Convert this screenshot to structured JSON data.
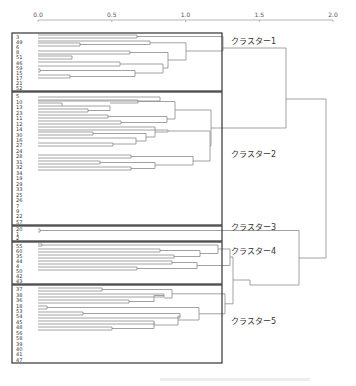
{
  "axis": {
    "ticks": [
      {
        "v": 0.0,
        "label": "0.0"
      },
      {
        "v": 0.5,
        "label": "0.5"
      },
      {
        "v": 1.0,
        "label": "1.0"
      },
      {
        "v": 1.5,
        "label": "1.5"
      },
      {
        "v": 2.0,
        "label": "2.0"
      }
    ],
    "x0": 38,
    "x_per_unit": 147.5,
    "y": 20
  },
  "clusters": [
    {
      "name": "クラスター1",
      "box": [
        12,
        33,
        222,
        91
      ],
      "label_y": 44,
      "leaves": [
        "3",
        "49",
        "6",
        "8",
        "51",
        "46",
        "59",
        "15",
        "17",
        "21",
        "52"
      ]
    },
    {
      "name": "クラスター2",
      "box": [
        12,
        92,
        222,
        225
      ],
      "label_y": 157,
      "leaves": [
        "5",
        "10",
        "13",
        "23",
        "11",
        "12",
        "14",
        "30",
        "16",
        "27",
        "24",
        "28",
        "31",
        "32",
        "34",
        "19",
        "29",
        "33",
        "25",
        "26",
        "7",
        "9",
        "22",
        "57"
      ]
    },
    {
      "name": "クラスター3",
      "box": [
        12,
        226,
        222,
        241
      ],
      "label_y": 230,
      "leaves": [
        "20",
        "1",
        "2"
      ]
    },
    {
      "name": "クラスター4",
      "box": [
        12,
        242,
        222,
        284
      ],
      "label_y": 254,
      "leaves": [
        "55",
        "60",
        "35",
        "44",
        "4",
        "50",
        "42",
        "43"
      ]
    },
    {
      "name": "クラスター5",
      "box": [
        12,
        285,
        222,
        363
      ],
      "label_y": 324,
      "leaves": [
        "37",
        "38",
        "36",
        "18",
        "53",
        "54",
        "45",
        "48",
        "56",
        "58",
        "39",
        "40",
        "41",
        "47"
      ]
    }
  ],
  "chart_data": {
    "type": "dendrogram",
    "title": "",
    "xlabel": "",
    "xlim": [
      0.0,
      2.0
    ],
    "tick_labels": [
      "0.0",
      "0.5",
      "1.0",
      "1.5",
      "2.0"
    ],
    "leaf_order": [
      "3",
      "49",
      "6",
      "8",
      "51",
      "46",
      "59",
      "15",
      "17",
      "21",
      "52",
      "5",
      "10",
      "13",
      "23",
      "11",
      "12",
      "14",
      "30",
      "16",
      "27",
      "24",
      "28",
      "31",
      "32",
      "34",
      "19",
      "29",
      "33",
      "25",
      "26",
      "7",
      "9",
      "22",
      "57",
      "20",
      "1",
      "2",
      "55",
      "60",
      "35",
      "44",
      "4",
      "50",
      "42",
      "43",
      "37",
      "38",
      "36",
      "18",
      "53",
      "54",
      "45",
      "48",
      "56",
      "58",
      "39",
      "40",
      "41",
      "47"
    ],
    "clusters": [
      {
        "name": "クラスター1",
        "members": [
          "3",
          "49",
          "6",
          "8",
          "51",
          "46",
          "59",
          "15",
          "17",
          "21",
          "52"
        ]
      },
      {
        "name": "クラスター2",
        "members": [
          "5",
          "10",
          "13",
          "23",
          "11",
          "12",
          "14",
          "30",
          "16",
          "27",
          "24",
          "28",
          "31",
          "32",
          "34",
          "19",
          "29",
          "33",
          "25",
          "26",
          "7",
          "9",
          "22",
          "57"
        ]
      },
      {
        "name": "クラスター3",
        "members": [
          "20",
          "1",
          "2"
        ]
      },
      {
        "name": "クラスター4",
        "members": [
          "55",
          "60",
          "35",
          "44",
          "4",
          "50",
          "42",
          "43"
        ]
      },
      {
        "name": "クラスター5",
        "members": [
          "37",
          "38",
          "36",
          "18",
          "53",
          "54",
          "45",
          "48",
          "56",
          "58",
          "39",
          "40",
          "41",
          "47"
        ]
      }
    ],
    "merge_heights_approx": {
      "cluster1": 1.15,
      "cluster2": 1.25,
      "cluster3": 0.02,
      "cluster4": 1.08,
      "cluster5": 1.1,
      "c4_c5": 1.15,
      "c3_c45": 1.77,
      "c1_c2": 1.68,
      "root": 1.95
    }
  },
  "links": [
    [
      [
        38,
        35
      ],
      [
        137,
        35
      ],
      [
        137,
        38
      ],
      [
        38,
        38
      ]
    ],
    [
      [
        38,
        43
      ],
      [
        80,
        43
      ],
      [
        80,
        46
      ],
      [
        38,
        46
      ]
    ],
    [
      [
        38,
        41
      ],
      [
        150,
        41
      ],
      [
        150,
        44.5
      ],
      [
        80,
        44.5
      ]
    ],
    [
      [
        38,
        51
      ],
      [
        130,
        51
      ],
      [
        130,
        54
      ],
      [
        38,
        54
      ]
    ],
    [
      [
        38,
        56
      ],
      [
        72,
        56
      ],
      [
        72,
        59
      ],
      [
        38,
        59
      ]
    ],
    [
      [
        38,
        62
      ],
      [
        120,
        62
      ],
      [
        120,
        66
      ],
      [
        38,
        66
      ]
    ],
    [
      [
        38,
        69
      ],
      [
        40,
        69
      ],
      [
        40,
        72
      ],
      [
        38,
        72
      ]
    ],
    [
      [
        38,
        75
      ],
      [
        70,
        75
      ],
      [
        70,
        78
      ],
      [
        38,
        78
      ]
    ],
    [
      [
        40,
        70.5
      ],
      [
        135,
        70.5
      ],
      [
        135,
        76.5
      ],
      [
        70,
        76.5
      ]
    ],
    [
      [
        120,
        64
      ],
      [
        163,
        64
      ],
      [
        163,
        73
      ],
      [
        135,
        73
      ]
    ],
    [
      [
        130,
        52.5
      ],
      [
        168,
        52.5
      ],
      [
        168,
        68
      ],
      [
        163,
        68
      ]
    ],
    [
      [
        150,
        42.8
      ],
      [
        186,
        42.8
      ],
      [
        186,
        60
      ],
      [
        168,
        60
      ]
    ],
    [
      [
        137,
        36.5
      ],
      [
        223,
        36.5
      ],
      [
        223,
        51
      ],
      [
        186,
        51
      ]
    ],
    [
      [
        38,
        103
      ],
      [
        62,
        103
      ],
      [
        62,
        106
      ],
      [
        38,
        106
      ]
    ],
    [
      [
        38,
        109
      ],
      [
        88,
        109
      ],
      [
        88,
        112
      ],
      [
        38,
        112
      ]
    ],
    [
      [
        38,
        115
      ],
      [
        108,
        115
      ],
      [
        108,
        118
      ],
      [
        38,
        118
      ]
    ],
    [
      [
        38,
        121
      ],
      [
        121,
        121
      ],
      [
        121,
        124
      ],
      [
        38,
        124
      ]
    ],
    [
      [
        88,
        110.5
      ],
      [
        110,
        110.5
      ],
      [
        110,
        106
      ],
      [
        62,
        106
      ]
    ],
    [
      [
        38,
        97
      ],
      [
        160,
        97
      ],
      [
        160,
        101
      ],
      [
        38,
        101
      ]
    ],
    [
      [
        38,
        100
      ],
      [
        138,
        100
      ],
      [
        138,
        103
      ],
      [
        110,
        103
      ]
    ],
    [
      [
        108,
        116.5
      ],
      [
        167,
        116.5
      ],
      [
        167,
        122.5
      ],
      [
        121,
        122.5
      ]
    ],
    [
      [
        138,
        101.5
      ],
      [
        175,
        101.5
      ],
      [
        175,
        119
      ],
      [
        167,
        119
      ]
    ],
    [
      [
        38,
        132
      ],
      [
        93,
        132
      ],
      [
        93,
        135
      ],
      [
        38,
        135
      ]
    ],
    [
      [
        38,
        143
      ],
      [
        113,
        143
      ],
      [
        113,
        146
      ],
      [
        38,
        146
      ]
    ],
    [
      [
        38,
        138
      ],
      [
        136,
        138
      ],
      [
        136,
        144
      ],
      [
        113,
        144
      ]
    ],
    [
      [
        93,
        133.5
      ],
      [
        146,
        133.5
      ],
      [
        146,
        141
      ],
      [
        136,
        141
      ]
    ],
    [
      [
        38,
        127
      ],
      [
        155,
        127
      ],
      [
        155,
        137
      ],
      [
        146,
        137
      ]
    ],
    [
      [
        38,
        130
      ],
      [
        168,
        130
      ],
      [
        168,
        132
      ],
      [
        155,
        132
      ]
    ],
    [
      [
        38,
        155
      ],
      [
        131,
        155
      ],
      [
        131,
        158
      ],
      [
        38,
        158
      ]
    ],
    [
      [
        38,
        161
      ],
      [
        100,
        161
      ],
      [
        100,
        164
      ],
      [
        38,
        164
      ]
    ],
    [
      [
        38,
        167
      ],
      [
        131,
        167
      ],
      [
        131,
        170
      ],
      [
        38,
        170
      ]
    ],
    [
      [
        100,
        162.5
      ],
      [
        155,
        162.5
      ],
      [
        155,
        168.5
      ],
      [
        131,
        168.5
      ]
    ],
    [
      [
        131,
        156.5
      ],
      [
        193,
        156.5
      ],
      [
        193,
        165
      ],
      [
        155,
        165
      ]
    ],
    [
      [
        168,
        131
      ],
      [
        210,
        131
      ],
      [
        210,
        161
      ],
      [
        193,
        161
      ]
    ],
    [
      [
        175,
        110
      ],
      [
        211,
        110
      ],
      [
        211,
        146
      ],
      [
        210,
        146
      ]
    ],
    [
      [
        211,
        128
      ],
      [
        286,
        128
      ],
      [
        286,
        48
      ],
      [
        223,
        48
      ]
    ],
    [
      [
        38,
        229
      ],
      [
        40,
        229
      ],
      [
        40,
        232
      ],
      [
        38,
        232
      ]
    ],
    [
      [
        40,
        230.5
      ],
      [
        299,
        230.5
      ],
      [
        299,
        285
      ],
      [
        250,
        285
      ]
    ],
    [
      [
        38,
        244
      ],
      [
        42,
        244
      ],
      [
        42,
        246
      ],
      [
        38,
        246
      ]
    ],
    [
      [
        38,
        249
      ],
      [
        160,
        249
      ],
      [
        160,
        252
      ],
      [
        38,
        252
      ]
    ],
    [
      [
        38,
        255
      ],
      [
        174,
        255
      ],
      [
        174,
        258
      ],
      [
        38,
        258
      ]
    ],
    [
      [
        160,
        250.5
      ],
      [
        200,
        250.5
      ],
      [
        200,
        256.5
      ],
      [
        174,
        256.5
      ]
    ],
    [
      [
        42,
        245
      ],
      [
        218,
        245
      ],
      [
        218,
        253.5
      ],
      [
        200,
        253.5
      ]
    ],
    [
      [
        38,
        261
      ],
      [
        172,
        261
      ],
      [
        172,
        264
      ],
      [
        38,
        264
      ]
    ],
    [
      [
        38,
        267
      ],
      [
        137,
        267
      ],
      [
        137,
        270
      ],
      [
        38,
        270
      ]
    ],
    [
      [
        137,
        268.5
      ],
      [
        197,
        268.5
      ],
      [
        197,
        262.5
      ],
      [
        172,
        262.5
      ]
    ],
    [
      [
        218,
        249
      ],
      [
        230,
        249
      ],
      [
        230,
        265.5
      ],
      [
        197,
        265.5
      ]
    ],
    [
      [
        38,
        288
      ],
      [
        102,
        288
      ],
      [
        102,
        291
      ],
      [
        38,
        291
      ]
    ],
    [
      [
        38,
        294
      ],
      [
        164,
        294
      ],
      [
        164,
        297
      ],
      [
        38,
        297
      ]
    ],
    [
      [
        38,
        300
      ],
      [
        129,
        300
      ],
      [
        129,
        303
      ],
      [
        38,
        303
      ]
    ],
    [
      [
        129,
        301.5
      ],
      [
        154,
        301.5
      ],
      [
        154,
        295.5
      ],
      [
        164,
        295.5
      ]
    ],
    [
      [
        102,
        289.5
      ],
      [
        172,
        289.5
      ],
      [
        172,
        298
      ],
      [
        164,
        298
      ]
    ],
    [
      [
        38,
        306
      ],
      [
        47,
        306
      ],
      [
        47,
        309
      ],
      [
        38,
        309
      ]
    ],
    [
      [
        38,
        312
      ],
      [
        83,
        312
      ],
      [
        83,
        315
      ],
      [
        38,
        315
      ]
    ],
    [
      [
        38,
        318
      ],
      [
        180,
        318
      ],
      [
        180,
        313.5
      ],
      [
        83,
        313.5
      ]
    ],
    [
      [
        38,
        321
      ],
      [
        154,
        321
      ],
      [
        154,
        324
      ],
      [
        38,
        324
      ]
    ],
    [
      [
        38,
        327
      ],
      [
        112,
        327
      ],
      [
        112,
        330
      ],
      [
        38,
        330
      ]
    ],
    [
      [
        112,
        328.5
      ],
      [
        154,
        328.5
      ],
      [
        154,
        322.5
      ]
    ],
    [
      [
        154,
        325
      ],
      [
        178,
        325
      ],
      [
        178,
        316
      ],
      [
        180,
        316
      ]
    ],
    [
      [
        47,
        307.5
      ],
      [
        199,
        307.5
      ],
      [
        199,
        320
      ],
      [
        178,
        320
      ]
    ],
    [
      [
        172,
        293.8
      ],
      [
        225,
        293.8
      ],
      [
        225,
        313.8
      ],
      [
        199,
        313.8
      ]
    ],
    [
      [
        230,
        257
      ],
      [
        233,
        257
      ],
      [
        233,
        303.8
      ],
      [
        225,
        303.8
      ]
    ],
    [
      [
        233,
        280
      ],
      [
        250,
        280
      ],
      [
        250,
        285
      ]
    ],
    [
      [
        299,
        258
      ],
      [
        326,
        258
      ],
      [
        326,
        99
      ],
      [
        286,
        99
      ]
    ]
  ]
}
